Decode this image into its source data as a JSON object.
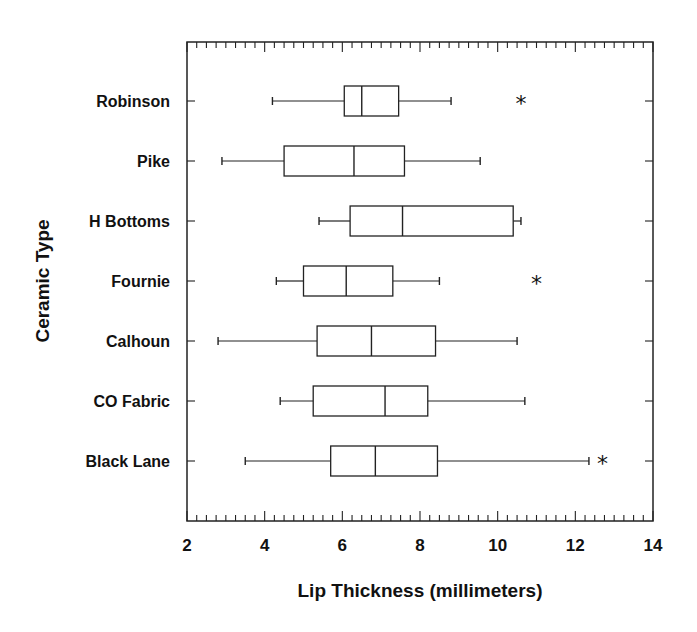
{
  "chart_data": {
    "type": "boxplot",
    "orientation": "horizontal",
    "title": "",
    "xlabel": "Lip Thickness (millimeters)",
    "ylabel": "Ceramic Type",
    "xlim": [
      2,
      14
    ],
    "xticks": [
      2,
      4,
      6,
      8,
      10,
      12,
      14
    ],
    "xtick_labels": [
      "2",
      "4",
      "6",
      "8",
      "10",
      "12",
      "14"
    ],
    "minor_tick_step": 0.25,
    "grid": false,
    "legend": null,
    "categories": [
      "Robinson",
      "Pike",
      "H Bottoms",
      "Fournie",
      "Calhoun",
      "CO Fabric",
      "Black Lane"
    ],
    "series": [
      {
        "name": "Robinson",
        "whisker_low": 4.2,
        "q1": 6.05,
        "median": 6.5,
        "q3": 7.45,
        "whisker_high": 8.8,
        "outliers": [
          10.6
        ]
      },
      {
        "name": "Pike",
        "whisker_low": 2.9,
        "q1": 4.5,
        "median": 6.3,
        "q3": 7.6,
        "whisker_high": 9.55,
        "outliers": []
      },
      {
        "name": "H Bottoms",
        "whisker_low": 5.4,
        "q1": 6.2,
        "median": 7.55,
        "q3": 10.4,
        "whisker_high": 10.6,
        "outliers": []
      },
      {
        "name": "Fournie",
        "whisker_low": 4.3,
        "q1": 5.0,
        "median": 6.1,
        "q3": 7.3,
        "whisker_high": 8.5,
        "outliers": [
          11.0
        ]
      },
      {
        "name": "Calhoun",
        "whisker_low": 2.8,
        "q1": 5.35,
        "median": 6.75,
        "q3": 8.4,
        "whisker_high": 10.5,
        "outliers": []
      },
      {
        "name": "CO Fabric",
        "whisker_low": 4.4,
        "q1": 5.25,
        "median": 7.1,
        "q3": 8.2,
        "whisker_high": 10.7,
        "outliers": []
      },
      {
        "name": "Black Lane",
        "whisker_low": 3.5,
        "q1": 5.7,
        "median": 6.85,
        "q3": 8.45,
        "whisker_high": 12.35,
        "outliers": [
          12.7
        ]
      }
    ],
    "outlier_marker": "*"
  }
}
